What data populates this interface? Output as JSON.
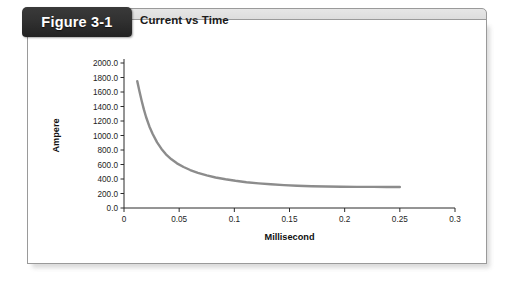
{
  "figure": {
    "tab_label": "Figure 3-1",
    "title": "Current vs Time"
  },
  "colors": {
    "tab_background": "#2d2d2d",
    "tab_text": "#ffffff",
    "header_band": "#d6d6d6",
    "panel_background": "#ffffff",
    "panel_border": "#9a9a9a",
    "curve": "#8c8c8c",
    "axis": "#2b2b2b",
    "text": "#1b1b1b"
  },
  "chart_data": {
    "type": "line",
    "title": "Current vs Time",
    "xlabel": "Millisecond",
    "ylabel": "Ampere",
    "xlim": [
      0,
      0.3
    ],
    "ylim": [
      0,
      2000
    ],
    "grid": false,
    "legend": "none",
    "x_ticks": [
      "0",
      "0.05",
      "0.1",
      "0.15",
      "0.2",
      "0.25",
      "0.3"
    ],
    "x_tick_values": [
      0,
      0.05,
      0.1,
      0.15,
      0.2,
      0.25,
      0.3
    ],
    "y_ticks": [
      "0.0",
      "200.0",
      "400.0",
      "600.0",
      "800.0",
      "1000.0",
      "1200.0",
      "1400.0",
      "1600.0",
      "1800.0",
      "2000.0"
    ],
    "y_tick_values": [
      0,
      200,
      400,
      600,
      800,
      1000,
      1200,
      1400,
      1600,
      1800,
      2000
    ],
    "series": [
      {
        "name": "Current",
        "color": "#8c8c8c",
        "x": [
          0.012,
          0.014,
          0.016,
          0.018,
          0.02,
          0.023,
          0.026,
          0.03,
          0.034,
          0.038,
          0.043,
          0.048,
          0.054,
          0.06,
          0.067,
          0.075,
          0.083,
          0.092,
          0.101,
          0.111,
          0.122,
          0.133,
          0.145,
          0.157,
          0.17,
          0.183,
          0.197,
          0.211,
          0.226,
          0.238,
          0.25
        ],
        "y": [
          1750,
          1610,
          1480,
          1360,
          1255,
          1125,
          1020,
          905,
          815,
          740,
          672,
          616,
          566,
          524,
          485,
          450,
          421,
          396,
          375,
          356,
          340,
          327,
          316,
          307,
          300,
          296,
          294,
          292,
          291,
          290,
          289
        ]
      }
    ]
  }
}
